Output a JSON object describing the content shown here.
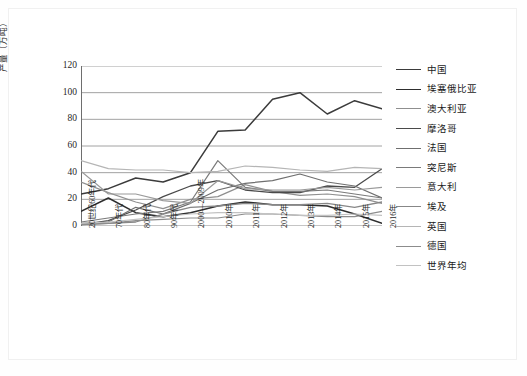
{
  "figure": {
    "caption": ""
  },
  "chart_data": {
    "type": "line",
    "title": "",
    "xlabel": "",
    "ylabel": "产量（万吨）",
    "ylim": [
      0,
      120
    ],
    "yticks": [
      0,
      20,
      40,
      60,
      80,
      100,
      120
    ],
    "grid": "horizontal",
    "legend_position": "right",
    "categories": [
      "20世纪60年代",
      "70年代",
      "80年代",
      "90年代",
      "2000—2009年",
      "2010年",
      "2011年",
      "2012年",
      "2013年",
      "2014年",
      "2015年",
      "2016年"
    ],
    "series": [
      {
        "name": "中国",
        "color": "#3b3b3b",
        "width": 1.5,
        "values": [
          24,
          28,
          36,
          33,
          40,
          71,
          72,
          95,
          100,
          84,
          94,
          88
        ]
      },
      {
        "name": "埃塞俄比亚",
        "color": "#2e2e2e",
        "width": 1.5,
        "values": [
          11,
          21,
          10,
          7,
          10,
          15,
          18,
          16,
          16,
          15,
          9,
          2
        ]
      },
      {
        "name": "澳大利亚",
        "color": "#8f8f8f",
        "width": 1.2,
        "values": [
          33,
          25,
          18,
          13,
          20,
          22,
          31,
          26,
          23,
          24,
          22,
          17
        ]
      },
      {
        "name": "摩洛哥",
        "color": "#4a4a4a",
        "width": 1.3,
        "values": [
          1,
          4,
          12,
          22,
          30,
          34,
          27,
          25,
          25,
          30,
          29,
          43
        ]
      },
      {
        "name": "法国",
        "color": "#6f6f6f",
        "width": 1.2,
        "values": [
          2,
          3,
          14,
          9,
          17,
          27,
          32,
          34,
          39,
          33,
          30,
          21
        ]
      },
      {
        "name": "突尼斯",
        "color": "#7a7a7a",
        "width": 1.2,
        "values": [
          3,
          6,
          9,
          11,
          18,
          49,
          29,
          26,
          26,
          27,
          24,
          21
        ]
      },
      {
        "name": "意大利",
        "color": "#9a9a9a",
        "width": 1.2,
        "values": [
          41,
          24,
          24,
          19,
          17,
          34,
          28,
          27,
          27,
          29,
          27,
          29
        ]
      },
      {
        "name": "埃及",
        "color": "#878787",
        "width": 1.3,
        "values": [
          1,
          2,
          3,
          9,
          14,
          15,
          17,
          16,
          16,
          17,
          14,
          18
        ]
      },
      {
        "name": "英国",
        "color": "#b5b5b5",
        "width": 1.2,
        "values": [
          49,
          43,
          42,
          42,
          40,
          41,
          45,
          44,
          42,
          41,
          44,
          43
        ]
      },
      {
        "name": "德国",
        "color": "#8c8c8c",
        "width": 1.2,
        "values": [
          1,
          2,
          4,
          5,
          6,
          6,
          9,
          9,
          8,
          7,
          7,
          11
        ]
      },
      {
        "name": "世界年均",
        "color": "#c2c2c2",
        "width": 1.2,
        "values": [
          2,
          3,
          5,
          7,
          9,
          10,
          10,
          9,
          8,
          8,
          9,
          8
        ]
      }
    ]
  }
}
